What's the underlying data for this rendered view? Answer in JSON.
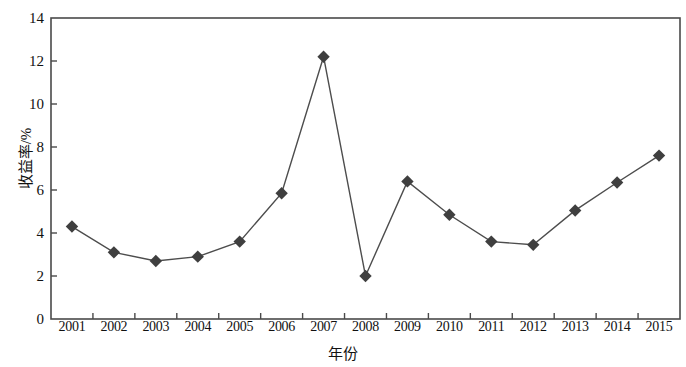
{
  "chart_data": {
    "type": "line",
    "title": "",
    "xlabel": "年份",
    "ylabel": "收益率/%",
    "categories": [
      "2001",
      "2002",
      "2003",
      "2004",
      "2005",
      "2006",
      "2007",
      "2008",
      "2009",
      "2010",
      "2011",
      "2012",
      "2013",
      "2014",
      "2015"
    ],
    "values": [
      4.3,
      3.1,
      2.7,
      2.9,
      3.6,
      5.85,
      12.2,
      2.0,
      6.4,
      4.85,
      3.6,
      3.45,
      5.05,
      6.35,
      7.6
    ],
    "series": [
      {
        "name": "收益率",
        "values": [
          4.3,
          3.1,
          2.7,
          2.9,
          3.6,
          5.85,
          12.2,
          2.0,
          6.4,
          4.85,
          3.6,
          3.45,
          5.05,
          6.35,
          7.6
        ]
      }
    ],
    "ylim": [
      0,
      14
    ],
    "y_ticks": [
      0,
      2,
      4,
      6,
      8,
      10,
      12,
      14
    ],
    "y_tick_labels": [
      "0",
      "2",
      "4",
      "6",
      "8",
      "10",
      "12",
      "14"
    ],
    "x_tick_labels": [
      "2001",
      "2002",
      "2003",
      "2004",
      "2005",
      "2006",
      "2007",
      "2008",
      "2009",
      "2010",
      "2011",
      "2012",
      "2013",
      "2014",
      "2015"
    ],
    "grid": false,
    "legend": null,
    "marker": "diamond",
    "line_color": "#4d4d4d",
    "marker_color": "#3f3f3f",
    "axis_color": "#4a4a4a"
  }
}
